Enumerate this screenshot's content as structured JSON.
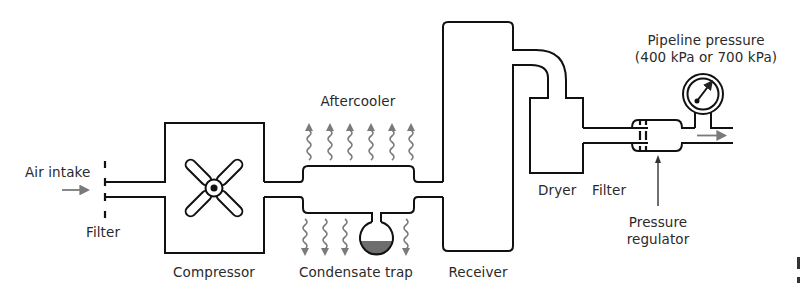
{
  "diagram": {
    "colors": {
      "line": "#111111",
      "heat_arrow": "#7a7a7a",
      "flow_arrow": "#7a7a7a",
      "condensate": "#6e6e6e",
      "background": "#ffffff"
    },
    "labels": {
      "air_intake": "Air intake",
      "intake_filter": "Filter",
      "compressor": "Compressor",
      "aftercooler": "Aftercooler",
      "condensate_trap": "Condensate trap",
      "receiver": "Receiver",
      "dryer": "Dryer",
      "line_filter": "Filter",
      "pressure_regulator_line1": "Pressure",
      "pressure_regulator_line2": "regulator",
      "pipeline_pressure_line1": "Pipeline pressure",
      "pipeline_pressure_line2": "(400 kPa or 700 kPa)"
    },
    "components": [
      {
        "id": "air-intake",
        "name": "Air intake",
        "icon": "arrow-right-icon"
      },
      {
        "id": "intake-filter",
        "name": "Filter",
        "icon": "filter-icon"
      },
      {
        "id": "compressor",
        "name": "Compressor",
        "icon": "fan-icon"
      },
      {
        "id": "aftercooler",
        "name": "Aftercooler",
        "icon": "heat-wave-icon"
      },
      {
        "id": "condensate-trap",
        "name": "Condensate trap",
        "icon": "trap-bulb-icon"
      },
      {
        "id": "receiver",
        "name": "Receiver",
        "icon": "tank-icon"
      },
      {
        "id": "dryer",
        "name": "Dryer",
        "icon": "dryer-box-icon"
      },
      {
        "id": "line-filter",
        "name": "Filter",
        "icon": "filter-icon"
      },
      {
        "id": "pressure-regulator",
        "name": "Pressure regulator",
        "icon": "regulator-icon"
      },
      {
        "id": "pressure-gauge",
        "name": "Pipeline pressure (400 kPa or 700 kPa)",
        "icon": "gauge-icon"
      }
    ],
    "flow_order": [
      "Air intake",
      "Filter",
      "Compressor",
      "Aftercooler",
      "Condensate trap",
      "Receiver",
      "Dryer",
      "Filter",
      "Pressure regulator",
      "Pipeline pressure"
    ],
    "heat_arrows": {
      "up_count": 6,
      "down_count": 4
    },
    "pipeline_pressure_values_kpa": [
      400,
      700
    ]
  }
}
